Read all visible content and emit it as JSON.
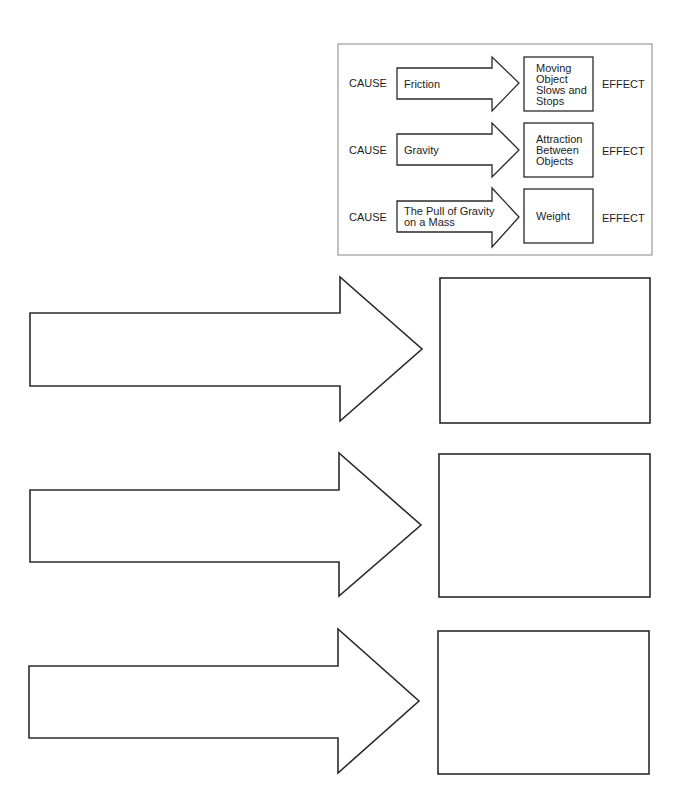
{
  "example": {
    "frame": {
      "x": 338,
      "y": 44,
      "w": 314,
      "h": 211,
      "border_color": "#9a9a9a"
    },
    "rows": [
      {
        "cause_label": "CAUSE",
        "cause_lines": [
          "Friction"
        ],
        "effect_lines": [
          "Moving",
          "Object",
          "Slows and",
          "Stops"
        ],
        "effect_label": "EFFECT",
        "arrow": {
          "x0": 397,
          "shaftTop": 68,
          "shaftBot": 99,
          "headX": 492,
          "headTop": 57,
          "headBot": 111,
          "tipX": 519,
          "tipY": 83
        },
        "box": {
          "x": 524,
          "y": 57,
          "w": 69,
          "h": 54
        }
      },
      {
        "cause_label": "CAUSE",
        "cause_lines": [
          "Gravity"
        ],
        "effect_lines": [
          "Attraction",
          "Between",
          "Objects"
        ],
        "effect_label": "EFFECT",
        "arrow": {
          "x0": 397,
          "shaftTop": 134,
          "shaftBot": 165,
          "headX": 492,
          "headTop": 123,
          "headBot": 177,
          "tipX": 519,
          "tipY": 150
        },
        "box": {
          "x": 524,
          "y": 123,
          "w": 69,
          "h": 54
        }
      },
      {
        "cause_label": "CAUSE",
        "cause_lines": [
          "The Pull of  Gravity",
          "on a Mass"
        ],
        "effect_lines": [
          "Weight"
        ],
        "effect_label": "EFFECT",
        "arrow": {
          "x0": 397,
          "shaftTop": 201,
          "shaftBot": 232,
          "headX": 492,
          "headTop": 188,
          "headBot": 247,
          "tipX": 519,
          "tipY": 217
        },
        "box": {
          "x": 524,
          "y": 189,
          "w": 69,
          "h": 54
        }
      }
    ]
  },
  "worksheet": {
    "rows": [
      {
        "cause_text": "",
        "effect_text": "",
        "arrow": {
          "x0": 30,
          "shaftTop": 313,
          "shaftBot": 386,
          "headX": 340,
          "headTop": 277,
          "headBot": 421,
          "tipX": 422,
          "tipY": 349
        },
        "box": {
          "x": 440,
          "y": 278,
          "w": 210,
          "h": 145
        }
      },
      {
        "cause_text": "",
        "effect_text": "",
        "arrow": {
          "x0": 30,
          "shaftTop": 490,
          "shaftBot": 562,
          "headX": 339,
          "headTop": 453,
          "headBot": 596,
          "tipX": 421,
          "tipY": 525
        },
        "box": {
          "x": 439,
          "y": 454,
          "w": 211,
          "h": 143
        }
      },
      {
        "cause_text": "",
        "effect_text": "",
        "arrow": {
          "x0": 29,
          "shaftTop": 666,
          "shaftBot": 738,
          "headX": 338,
          "headTop": 629,
          "headBot": 773,
          "tipX": 419,
          "tipY": 701
        },
        "box": {
          "x": 438,
          "y": 631,
          "w": 211,
          "h": 143
        }
      }
    ]
  }
}
